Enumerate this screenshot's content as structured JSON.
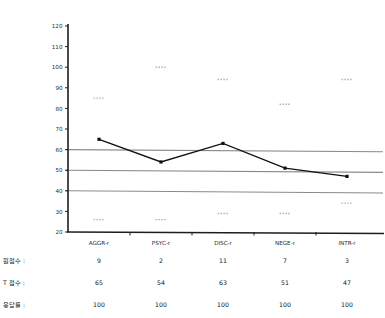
{
  "chart_data": {
    "type": "line",
    "title": "",
    "xlabel": "",
    "ylabel": "",
    "categories": [
      "AGGR-r",
      "PSYC-r",
      "DISC-r",
      "NEGE-r",
      "INTR-r"
    ],
    "series": [
      {
        "name": "T Score",
        "values": [
          65,
          54,
          63,
          51,
          47
        ]
      }
    ],
    "upper_bound_marks": [
      85,
      100,
      94,
      82,
      94
    ],
    "lower_bound_marks": [
      26,
      20,
      29,
      29,
      34
    ],
    "reference_lines": [
      60,
      50,
      40
    ],
    "ylim": [
      20,
      120
    ],
    "yticks": [
      20,
      30,
      40,
      50,
      60,
      70,
      80,
      90,
      100,
      110,
      120
    ],
    "ytick_labels": [
      "20",
      "30",
      "40",
      "50",
      "60",
      "70",
      "80",
      "90",
      "100",
      "110",
      "120"
    ],
    "grid": false,
    "legend": "none",
    "marker": "square",
    "line_color": "#111111",
    "reference_line_color": "#8a8a8a",
    "bound_mark_color": "#b8b8b8"
  },
  "table": {
    "rows": [
      {
        "label": "원점수 :",
        "values": [
          "9",
          "2",
          "11",
          "7",
          "3"
        ]
      },
      {
        "label": "T 점수 :",
        "values": [
          "65",
          "54",
          "63",
          "51",
          "47"
        ]
      },
      {
        "label": "응답률 :",
        "values": [
          "100",
          "100",
          "100",
          "100",
          "100"
        ]
      }
    ]
  }
}
